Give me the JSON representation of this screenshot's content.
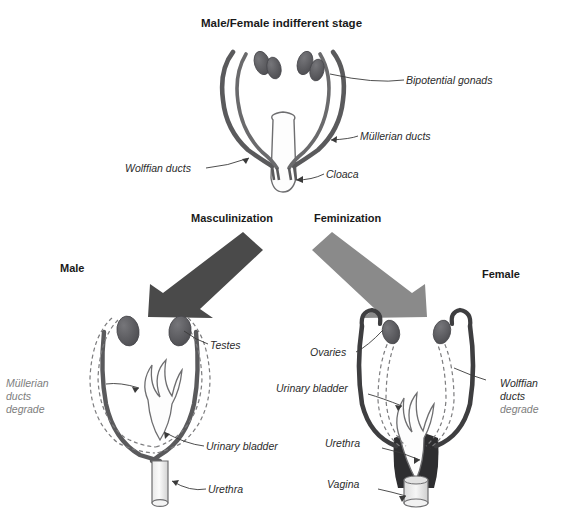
{
  "figure": {
    "title": "Male/Female indifferent stage",
    "background_color": "#ffffff",
    "text_color": "#2b2b2b",
    "duct_color": "#58585a",
    "gonad_color": "#5a5a5c",
    "masculinization_arrow_color": "#4a4a4a",
    "feminization_arrow_color": "#8a8a8a",
    "outline_color": "#6e6e70"
  },
  "indifferent_stage": {
    "title": "Male/Female indifferent stage",
    "labels": {
      "bipotential_gonads": "Bipotential gonads",
      "mullerian_ducts": "Müllerian ducts",
      "wolffian_ducts": "Wolffian ducts",
      "cloaca": "Cloaca"
    }
  },
  "pathways": {
    "masculinization": "Masculinization",
    "feminization": "Feminization"
  },
  "male": {
    "heading": "Male",
    "labels": {
      "testes": "Testes",
      "urinary_bladder": "Urinary bladder",
      "urethra": "Urethra",
      "mullerian_degrade_line1": "Müllerian",
      "mullerian_degrade_line2": "ducts",
      "mullerian_degrade_line3": "degrade"
    }
  },
  "female": {
    "heading": "Female",
    "labels": {
      "ovaries": "Ovaries",
      "urinary_bladder": "Urinary bladder",
      "urethra": "Urethra",
      "vagina": "Vagina",
      "wolffian_degrade_line1": "Wolffian",
      "wolffian_degrade_line2": "ducts",
      "wolffian_degrade_line3": "degrade"
    }
  }
}
